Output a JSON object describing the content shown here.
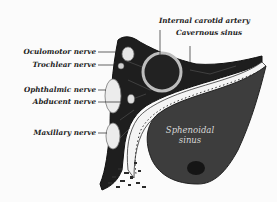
{
  "figure": {
    "type": "anatomical-illustration"
  },
  "labels": {
    "internal_carotid": "Internal carotid artery",
    "cavernous_sinus": "Cavernous sinus",
    "oculomotor": "Oculomotor nerve",
    "trochlear": "Trochlear nerve",
    "ophthalmic": "Ophthalmic nerve",
    "abducent": "Abducent nerve",
    "maxillary": "Maxillary nerve",
    "sphenoidal_line1": "Sphenoidal",
    "sphenoidal_line2": "sinus"
  },
  "colors": {
    "background": "#fbfbfb",
    "ink": "#1a1a1a",
    "sinus_fill": "#3a3a3a",
    "sinus_dark": "#2a2a2a",
    "nerve_fill": "#e8e8e8",
    "bone": "#f2f2f2"
  }
}
